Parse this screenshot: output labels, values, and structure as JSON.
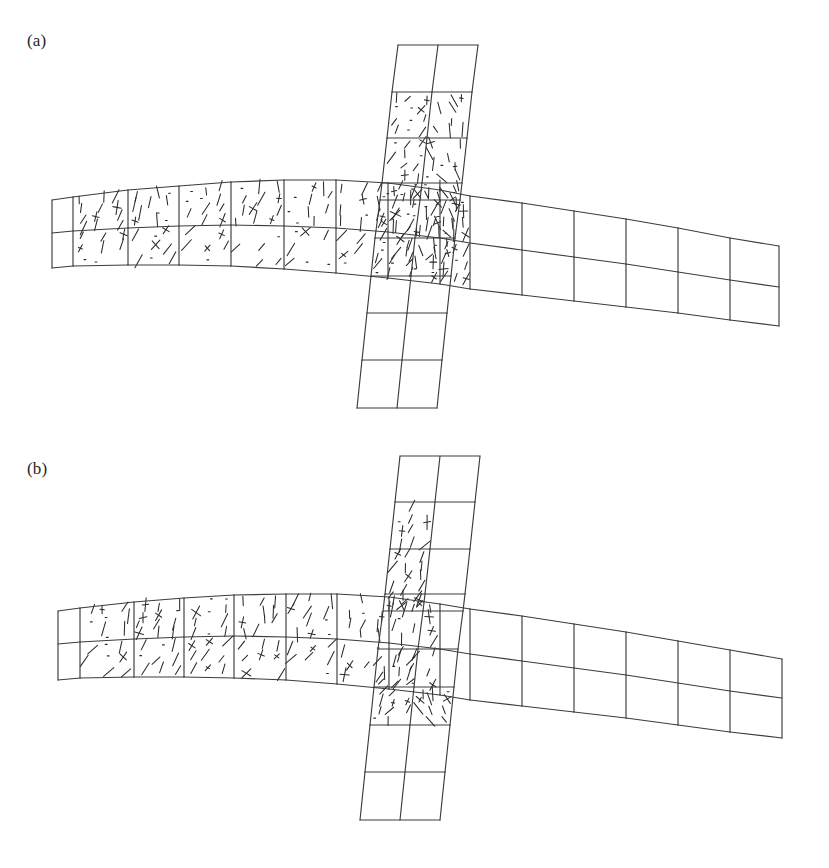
{
  "figure": {
    "kind": "finite-element-mesh-crack-pattern",
    "background_color": "#ffffff",
    "mesh_line_color": "#3c3c3c",
    "crack_line_color": "#2b2b2b",
    "width": 829,
    "height": 868,
    "partial_caption": ""
  },
  "panels": [
    {
      "id": "a",
      "label": "(a)",
      "description": "Cruciform beam-column joint mesh with dense distributed crack marks across left beam, joint core and upper column"
    },
    {
      "id": "b",
      "label": "(b)",
      "description": "Cruciform beam-column joint mesh with fewer crack marks concentrated in left beam and left column strip"
    }
  ],
  "chart_data": {
    "type": "diagram",
    "title": "",
    "subtitle": "",
    "xlabel": "",
    "ylabel": "",
    "legend": [],
    "geometry": {
      "note": "Deformed cruciform FE mesh. Horizontal beam = 2 rows of quad elements; vertical column = 2 columns of quad elements. Coordinates are panel-local pixels (829 x 434).",
      "panel_a": {
        "beam": {
          "rows": 2,
          "columns": 14,
          "x_stations": [
            52,
            73,
            128,
            179,
            231,
            284,
            336,
            388,
            440,
            470,
            522,
            574,
            626,
            678,
            730,
            779
          ],
          "top_y": [
            200,
            197,
            190,
            186,
            182,
            180,
            180,
            183,
            190,
            196,
            203,
            211,
            219,
            228,
            238,
            246
          ],
          "mid_y": [
            233,
            231,
            228,
            226,
            225,
            226,
            228,
            232,
            238,
            243,
            250,
            257,
            264,
            272,
            280,
            287
          ],
          "bot_y": [
            268,
            266,
            265,
            265,
            266,
            269,
            273,
            278,
            284,
            289,
            295,
            301,
            307,
            313,
            320,
            326
          ]
        },
        "column": {
          "rows": 8,
          "columns": 2,
          "y_stations": [
            45,
            92,
            138,
            183,
            200,
            238,
            276,
            313,
            360,
            408
          ],
          "left_x": [
            398,
            392,
            387,
            382,
            380,
            375,
            371,
            367,
            362,
            357
          ],
          "mid_x": [
            438,
            432,
            427,
            422,
            420,
            415,
            411,
            407,
            402,
            397
          ],
          "right_x": [
            478,
            472,
            467,
            462,
            460,
            455,
            451,
            447,
            442,
            437
          ]
        }
      },
      "panel_b": {
        "beam": {
          "rows": 2,
          "columns": 14,
          "x_stations": [
            58,
            80,
            134,
            184,
            234,
            286,
            337,
            389,
            440,
            470,
            522,
            574,
            626,
            678,
            730,
            782
          ],
          "top_y": [
            177,
            174,
            168,
            164,
            161,
            160,
            160,
            163,
            170,
            175,
            182,
            190,
            198,
            207,
            216,
            225
          ],
          "mid_y": [
            210,
            208,
            205,
            203,
            202,
            203,
            205,
            209,
            215,
            220,
            227,
            234,
            241,
            249,
            257,
            264
          ],
          "bot_y": [
            246,
            244,
            243,
            243,
            244,
            246,
            250,
            255,
            261,
            266,
            272,
            278,
            284,
            291,
            298,
            304
          ]
        },
        "column": {
          "rows": 8,
          "columns": 2,
          "y_stations": [
            22,
            68,
            115,
            160,
            177,
            215,
            253,
            291,
            338,
            386
          ],
          "left_x": [
            400,
            395,
            390,
            385,
            383,
            378,
            374,
            370,
            365,
            360
          ],
          "mid_x": [
            440,
            435,
            430,
            425,
            423,
            418,
            414,
            410,
            405,
            400
          ],
          "right_x": [
            480,
            475,
            470,
            465,
            463,
            458,
            454,
            450,
            445,
            440
          ]
        }
      }
    },
    "crack_zones": {
      "panel_a": {
        "beam_left_marked_columns": [
          1,
          2,
          3,
          4,
          5,
          6,
          7
        ],
        "beam_right_marked_columns": [
          8
        ],
        "beam_unmarked_columns": [
          0,
          9,
          10,
          11,
          12,
          13
        ],
        "column_marked_rows": [
          1,
          2,
          3,
          4,
          5
        ],
        "column_unmarked_rows": [
          0,
          6,
          7
        ],
        "density": "high",
        "marks_total": 238
      },
      "panel_b": {
        "beam_left_marked_columns": [
          1,
          2,
          3,
          4,
          5,
          6,
          7
        ],
        "beam_right_marked_columns": [],
        "beam_unmarked_columns": [
          0,
          8,
          9,
          10,
          11,
          12,
          13
        ],
        "column_marked_rows": [
          1,
          2,
          3,
          5,
          6
        ],
        "column_marked_side": "left-column-strip",
        "column_unmarked_rows": [
          0,
          4,
          7
        ],
        "density": "moderate",
        "marks_total": 126
      }
    }
  }
}
